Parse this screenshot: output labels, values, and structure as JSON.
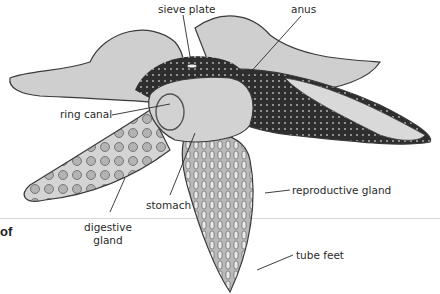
{
  "diagram": {
    "labels": {
      "sieve_plate": "sieve plate",
      "anus": "anus",
      "ring_canal": "ring canal",
      "stomach": "stomach",
      "digestive_gland_line1": "digestive",
      "digestive_gland_line2": "gland",
      "reproductive_gland": "reproductive gland",
      "tube_feet": "tube feet"
    },
    "page_fragment": "of"
  },
  "colors": {
    "body_fill": "#c9c9c9",
    "dark_region": "#2e2e2e",
    "outline": "#3a3a3a",
    "rule": "#d6d6d6"
  }
}
